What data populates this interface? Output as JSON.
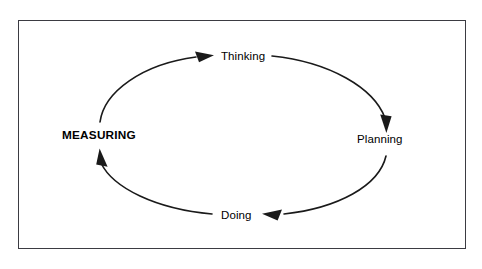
{
  "diagram": {
    "type": "cycle",
    "title": "",
    "direction": "clockwise",
    "frame": {
      "border_color": "#3b3b42",
      "background_color": "#ffffff"
    },
    "stroke_color": "#1a1a1a",
    "text_color": "#000000",
    "nodes": [
      {
        "id": "measuring",
        "label": "MEASURING",
        "position": "left",
        "emphasis": "bold"
      },
      {
        "id": "thinking",
        "label": "Thinking",
        "position": "top",
        "emphasis": "regular"
      },
      {
        "id": "planning",
        "label": "Planning",
        "position": "right",
        "emphasis": "regular"
      },
      {
        "id": "doing",
        "label": "Doing",
        "position": "bottom",
        "emphasis": "regular"
      }
    ],
    "edges": [
      {
        "id": "measuring-to-thinking",
        "from": "measuring",
        "to": "thinking",
        "arrow": "end"
      },
      {
        "id": "thinking-to-planning",
        "from": "thinking",
        "to": "planning",
        "arrow": "end"
      },
      {
        "id": "planning-to-doing",
        "from": "planning",
        "to": "doing",
        "arrow": "end"
      },
      {
        "id": "doing-to-measuring",
        "from": "doing",
        "to": "measuring",
        "arrow": "end"
      }
    ]
  }
}
